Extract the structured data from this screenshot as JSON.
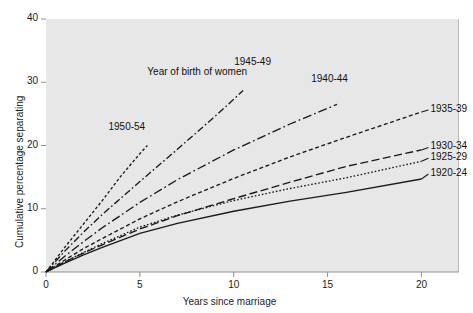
{
  "chart_data": {
    "type": "line",
    "title": "",
    "xlabel": "Years since marriage",
    "ylabel": "Cumulative percentage separating",
    "annotation": "Year of birth of women",
    "xlim": [
      0,
      22
    ],
    "ylim": [
      0,
      40
    ],
    "xticks": [
      0,
      5,
      10,
      15,
      20
    ],
    "yticks": [
      0,
      10,
      20,
      30,
      40
    ],
    "xtick_labels": [
      "0",
      "5",
      "10",
      "15",
      "20"
    ],
    "ytick_labels": [
      "0",
      "10",
      "20",
      "30",
      "40"
    ],
    "grid": false,
    "legend_position": "inline-labels",
    "series": [
      {
        "name": "1950-54",
        "style": "fine-dashed",
        "label_x": 4.5,
        "label_y": 21.6,
        "x": [
          0,
          1,
          2,
          3,
          4,
          5,
          5.4
        ],
        "y": [
          0,
          3.9,
          7.6,
          11.3,
          15.2,
          18.7,
          20.0
        ]
      },
      {
        "name": "1945-49",
        "style": "dash-dot",
        "label_x": 11.2,
        "label_y": 31.9,
        "x": [
          0,
          1,
          2,
          3,
          5,
          7,
          9,
          10,
          10.5
        ],
        "y": [
          0,
          3.3,
          6.3,
          9.1,
          14.3,
          19.4,
          24.6,
          27.3,
          28.7
        ]
      },
      {
        "name": "1940-44",
        "style": "long-dash-dot",
        "label_x": 15.3,
        "label_y": 29.2,
        "x": [
          0,
          1,
          2,
          3,
          5,
          7,
          10,
          13,
          15.5
        ],
        "y": [
          0,
          2.5,
          4.8,
          7.0,
          11.0,
          14.6,
          19.3,
          23.4,
          26.5
        ]
      },
      {
        "name": "1935-39",
        "style": "dashed",
        "label_x": 20.6,
        "label_y": 25.6,
        "x": [
          0,
          1,
          2,
          3,
          5,
          7,
          10,
          13,
          16,
          20
        ],
        "y": [
          0,
          1.9,
          3.7,
          5.3,
          8.4,
          11.1,
          14.8,
          18.2,
          21.3,
          25.3
        ]
      },
      {
        "name": "1930-34",
        "style": "long-dashed",
        "label_x": 20.6,
        "label_y": 19.7,
        "x": [
          0,
          1,
          2,
          3,
          5,
          7,
          10,
          13,
          16,
          20
        ],
        "y": [
          0,
          1.6,
          3.0,
          4.3,
          6.8,
          8.9,
          11.6,
          14.2,
          16.7,
          19.3
        ]
      },
      {
        "name": "1925-29",
        "style": "dotted",
        "label_x": 20.6,
        "label_y": 18.0,
        "x": [
          0,
          1,
          2,
          3,
          5,
          7,
          10,
          13,
          16,
          20
        ],
        "y": [
          0,
          1.6,
          3.1,
          4.5,
          7.1,
          9.0,
          11.3,
          13.2,
          14.9,
          17.5
        ]
      },
      {
        "name": "1920-24",
        "style": "solid",
        "label_x": 20.6,
        "label_y": 15.5,
        "x": [
          0,
          1,
          2,
          3,
          5,
          7,
          10,
          13,
          16,
          20
        ],
        "y": [
          0,
          1.4,
          2.7,
          3.9,
          6.1,
          7.7,
          9.6,
          11.2,
          12.6,
          14.7
        ]
      }
    ]
  },
  "axes": {
    "y_axis_title": "Cumulative percentage separating",
    "x_axis_title": "Years since marriage"
  },
  "colors": {
    "plot_background": "#e7e7e7",
    "figure_background": "#ffffff",
    "line": "#1a1a1a",
    "text": "#1c1c1c"
  }
}
